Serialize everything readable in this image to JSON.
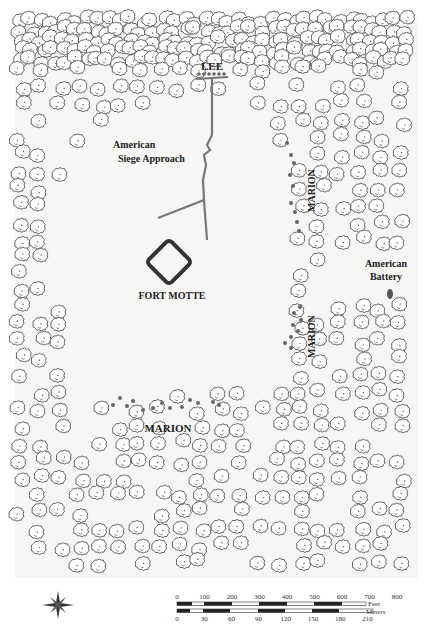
{
  "map": {
    "title": "Fort Motte siege map",
    "background": "#f6f6f4",
    "tree_color": "#555555",
    "labels": {
      "lee": "LEE",
      "siege_approach_line1": "American",
      "siege_approach_line2": "Siege Approach",
      "fort": "FORT MOTTE",
      "marion_north": "MARION",
      "marion_east": "MARION",
      "marion_south": "MARION",
      "battery_line1": "American",
      "battery_line2": "Battery"
    },
    "features": {
      "fort": {
        "shape": "diamond",
        "color": "#333333"
      },
      "siege_trench": {
        "color": "#777777"
      },
      "troop_dots": {
        "color": "#666666"
      },
      "battery_marker": {
        "color": "#555555"
      }
    }
  },
  "scale_bar": {
    "feet_unit": "Feet",
    "feet_ticks": [
      "0",
      "100",
      "200",
      "300",
      "400",
      "500",
      "600",
      "700",
      "800"
    ],
    "meters_unit": "Meters",
    "meters_ticks": [
      "0",
      "30",
      "60",
      "90",
      "120",
      "150",
      "180",
      "210"
    ]
  },
  "compass": {
    "icon": "compass-rose-icon",
    "label": "N"
  }
}
